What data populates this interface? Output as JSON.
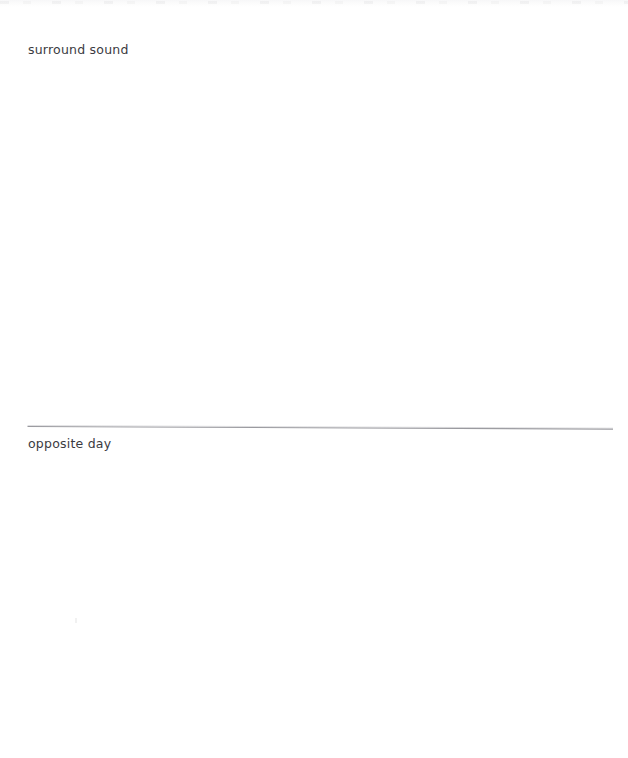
{
  "page": {
    "width": 628,
    "height": 758,
    "background_color": "#ffffff",
    "kind": "scanned-page"
  },
  "content": {
    "entries": [
      {
        "id": "surround-sound",
        "text": "surround sound",
        "color": "#3b3b3f",
        "x": 28,
        "baseline_y": 56
      },
      {
        "id": "opposite-day",
        "text": "opposite day",
        "color": "#3b3b3f",
        "x": 28,
        "baseline_y": 450
      }
    ]
  },
  "divider": {
    "name": "horizontal-rule",
    "color": "#9a9a9f",
    "thickness": 1,
    "x_start": 28,
    "x_end": 613,
    "y_start": 426,
    "y_end": 429
  },
  "artifacts": {
    "top_edge_noise": "scan-edge-noise",
    "speck": "scan-speck"
  }
}
